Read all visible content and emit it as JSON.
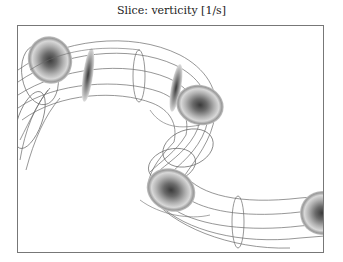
{
  "figure": {
    "title": "Slice: verticity [1/s]",
    "colors": {
      "frame": "#777777",
      "wire": "#666666",
      "disk_outer": "#d8d8d8",
      "disk_mid": "#a0a0a0",
      "disk_core": "#4a4a4a"
    },
    "slices": [
      {
        "id": "slice-1",
        "cx": 50,
        "cy": 60,
        "rx": 22,
        "ry": 24,
        "orientation": "face"
      },
      {
        "id": "slice-2",
        "cx": 88,
        "cy": 75,
        "rx": 5,
        "ry": 28,
        "orientation": "edge"
      },
      {
        "id": "slice-3",
        "cx": 176,
        "cy": 88,
        "rx": 5,
        "ry": 25,
        "orientation": "edge"
      },
      {
        "id": "slice-4",
        "cx": 200,
        "cy": 105,
        "rx": 24,
        "ry": 20,
        "orientation": "face"
      },
      {
        "id": "slice-5",
        "cx": 171,
        "cy": 190,
        "rx": 25,
        "ry": 22,
        "orientation": "face"
      },
      {
        "id": "slice-6",
        "cx": 322,
        "cy": 213,
        "rx": 25,
        "ry": 22,
        "orientation": "face-clipped"
      }
    ]
  }
}
